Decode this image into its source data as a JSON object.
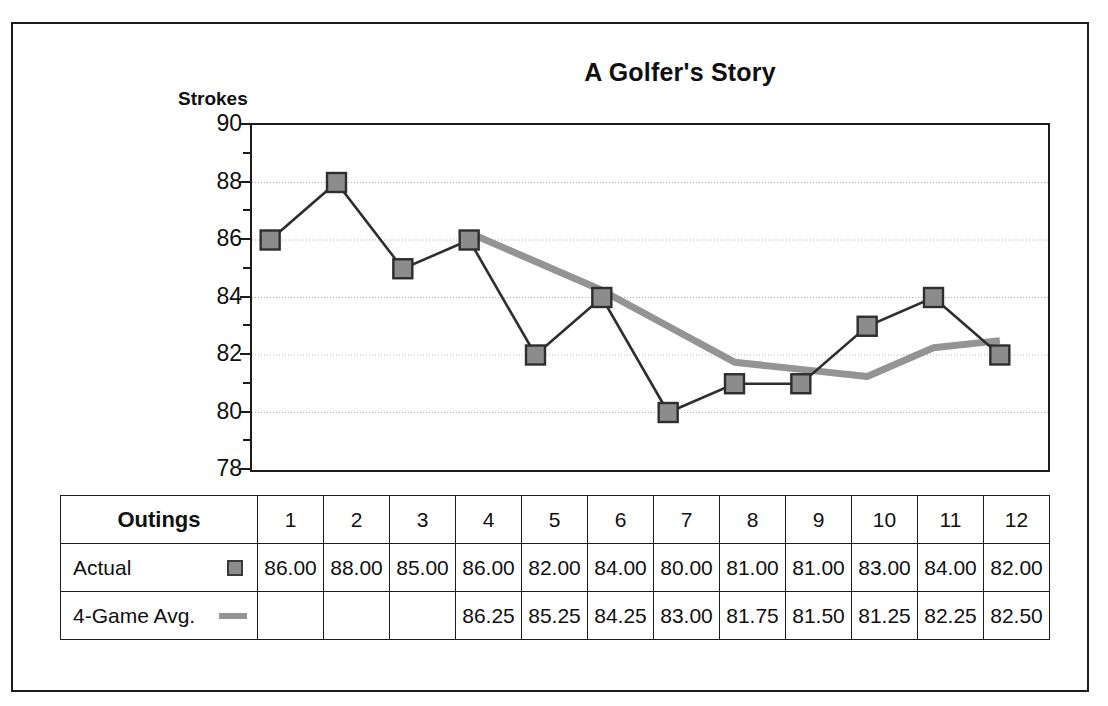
{
  "chart_data": {
    "type": "line",
    "title": "A Golfer's Story",
    "xlabel": "Outings",
    "ylabel": "Strokes",
    "ylim": [
      78,
      90
    ],
    "ytick_labels": [
      "90",
      "88",
      "86",
      "84",
      "82",
      "80",
      "78"
    ],
    "ytick_values": [
      90,
      88,
      86,
      84,
      82,
      80,
      78
    ],
    "minor_ticks": [
      89,
      87,
      85,
      83,
      81,
      79
    ],
    "grid": "horizontal-dotted",
    "legend_position": "table",
    "categories": [
      "1",
      "2",
      "3",
      "4",
      "5",
      "6",
      "7",
      "8",
      "9",
      "10",
      "11",
      "12"
    ],
    "series": [
      {
        "name": "Actual",
        "marker": "square",
        "color": "#8c8c8c",
        "line_color": "#2e2e2e",
        "values": [
          86.0,
          88.0,
          85.0,
          86.0,
          82.0,
          84.0,
          80.0,
          81.0,
          81.0,
          83.0,
          84.0,
          82.0
        ],
        "labels": [
          "86.00",
          "88.00",
          "85.00",
          "86.00",
          "82.00",
          "84.00",
          "80.00",
          "81.00",
          "81.00",
          "83.00",
          "84.00",
          "82.00"
        ]
      },
      {
        "name": "4-Game Avg.",
        "marker": "none",
        "color": "#949494",
        "line_color": "#949494",
        "values": [
          null,
          null,
          null,
          86.25,
          85.25,
          84.25,
          83.0,
          81.75,
          81.5,
          81.25,
          82.25,
          82.5
        ],
        "labels": [
          "",
          "",
          "",
          "86.25",
          "85.25",
          "84.25",
          "83.00",
          "81.75",
          "81.50",
          "81.25",
          "82.25",
          "82.50"
        ]
      }
    ]
  },
  "table": {
    "header_label": "Outings",
    "columns": [
      "1",
      "2",
      "3",
      "4",
      "5",
      "6",
      "7",
      "8",
      "9",
      "10",
      "11",
      "12"
    ],
    "rows": [
      {
        "label": "Actual",
        "swatch": "square-marker-swatch",
        "values": [
          "86.00",
          "88.00",
          "85.00",
          "86.00",
          "82.00",
          "84.00",
          "80.00",
          "81.00",
          "81.00",
          "83.00",
          "84.00",
          "82.00"
        ]
      },
      {
        "label": "4-Game Avg.",
        "swatch": "line-swatch",
        "values": [
          "",
          "",
          "",
          "86.25",
          "85.25",
          "84.25",
          "83.00",
          "81.75",
          "81.50",
          "81.25",
          "82.25",
          "82.50"
        ]
      }
    ]
  },
  "colors": {
    "frame": "#1c1c1c",
    "marker_fill": "#8c8c8c",
    "marker_stroke": "#3a3a3a",
    "actual_line": "#2e2e2e",
    "avg_line": "#949494",
    "gridline": "#b4b4b4",
    "text": "#101010"
  }
}
